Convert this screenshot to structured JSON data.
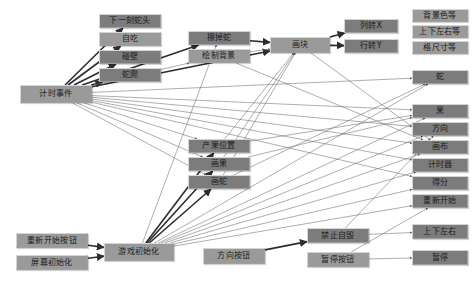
{
  "diagram": {
    "node_fill": "#8d8d8d",
    "node_border": "#c9c9c9",
    "edge_color": "#3a3a3a",
    "background": "#ffffff",
    "nodes": [
      {
        "id": "timer_event",
        "label": "计时事件",
        "x": 20,
        "y": 85,
        "w": 72,
        "h": 18,
        "tone": "light"
      },
      {
        "id": "next_head",
        "label": "下一刻蛇头",
        "x": 99,
        "y": 14,
        "w": 62,
        "h": 14,
        "tone": "dark"
      },
      {
        "id": "self_eat",
        "label": "自吃",
        "x": 99,
        "y": 32,
        "w": 62,
        "h": 14,
        "tone": "light"
      },
      {
        "id": "hit_wall",
        "label": "碰壁",
        "x": 99,
        "y": 50,
        "w": 62,
        "h": 14,
        "tone": "dark"
      },
      {
        "id": "snake_crawl",
        "label": "蛇爬",
        "x": 99,
        "y": 68,
        "w": 62,
        "h": 14,
        "tone": "dark"
      },
      {
        "id": "erase_snake",
        "label": "擦掉蛇",
        "x": 188,
        "y": 31,
        "w": 62,
        "h": 14,
        "tone": "dark"
      },
      {
        "id": "draw_bg",
        "label": "绘制背景",
        "x": 188,
        "y": 49,
        "w": 62,
        "h": 14,
        "tone": "light"
      },
      {
        "id": "draw_block",
        "label": "画块",
        "x": 270,
        "y": 37,
        "w": 60,
        "h": 16,
        "tone": "light"
      },
      {
        "id": "col_to_x",
        "label": "列转X",
        "x": 344,
        "y": 19,
        "w": 54,
        "h": 14,
        "tone": "dark"
      },
      {
        "id": "row_to_y",
        "label": "行转Y",
        "x": 344,
        "y": 39,
        "w": 54,
        "h": 14,
        "tone": "dark"
      },
      {
        "id": "bg_color_etc",
        "label": "背景色等",
        "x": 412,
        "y": 9,
        "w": 56,
        "h": 13,
        "tone": "light"
      },
      {
        "id": "updown_etc",
        "label": "上下左右等",
        "x": 412,
        "y": 25,
        "w": 56,
        "h": 13,
        "tone": "light"
      },
      {
        "id": "cell_size_etc",
        "label": "格尺寸等",
        "x": 412,
        "y": 41,
        "w": 56,
        "h": 13,
        "tone": "light"
      },
      {
        "id": "var_snake",
        "label": "蛇",
        "x": 412,
        "y": 70,
        "w": 56,
        "h": 14,
        "tone": "dark"
      },
      {
        "id": "var_fruit",
        "label": "果",
        "x": 412,
        "y": 104,
        "w": 56,
        "h": 14,
        "tone": "dark"
      },
      {
        "id": "var_direction",
        "label": "方向",
        "x": 412,
        "y": 122,
        "w": 56,
        "h": 14,
        "tone": "dark"
      },
      {
        "id": "var_canvas",
        "label": "画布",
        "x": 412,
        "y": 140,
        "w": 56,
        "h": 14,
        "tone": "dark"
      },
      {
        "id": "var_timer",
        "label": "计时器",
        "x": 412,
        "y": 158,
        "w": 56,
        "h": 14,
        "tone": "dark"
      },
      {
        "id": "var_score",
        "label": "得分",
        "x": 412,
        "y": 176,
        "w": 56,
        "h": 14,
        "tone": "dark"
      },
      {
        "id": "var_restart",
        "label": "重新开始",
        "x": 412,
        "y": 194,
        "w": 56,
        "h": 14,
        "tone": "dark"
      },
      {
        "id": "fruit_pos",
        "label": "产果位置",
        "x": 188,
        "y": 139,
        "w": 62,
        "h": 14,
        "tone": "dark"
      },
      {
        "id": "draw_fruit",
        "label": "画果",
        "x": 188,
        "y": 157,
        "w": 62,
        "h": 14,
        "tone": "dark"
      },
      {
        "id": "draw_snake",
        "label": "画蛇",
        "x": 188,
        "y": 175,
        "w": 62,
        "h": 14,
        "tone": "dark"
      },
      {
        "id": "restart_btn",
        "label": "重新开始按钮",
        "x": 16,
        "y": 233,
        "w": 72,
        "h": 15,
        "tone": "light"
      },
      {
        "id": "screen_init",
        "label": "屏幕初始化",
        "x": 16,
        "y": 255,
        "w": 72,
        "h": 15,
        "tone": "light"
      },
      {
        "id": "game_init",
        "label": "游戏初始化",
        "x": 104,
        "y": 243,
        "w": 70,
        "h": 18,
        "tone": "light"
      },
      {
        "id": "dir_btn",
        "label": "方向按钮",
        "x": 203,
        "y": 248,
        "w": 62,
        "h": 16,
        "tone": "light"
      },
      {
        "id": "no_suicide",
        "label": "禁止自毁",
        "x": 307,
        "y": 228,
        "w": 62,
        "h": 15,
        "tone": "dark"
      },
      {
        "id": "pause_btn",
        "label": "暂停按钮",
        "x": 307,
        "y": 252,
        "w": 62,
        "h": 15,
        "tone": "light"
      },
      {
        "id": "updown_lr",
        "label": "上下左右",
        "x": 412,
        "y": 224,
        "w": 56,
        "h": 15,
        "tone": "dark"
      },
      {
        "id": "pause",
        "label": "暂停",
        "x": 412,
        "y": 250,
        "w": 56,
        "h": 15,
        "tone": "dark"
      }
    ],
    "edges": [
      {
        "from": "timer_event",
        "to": "next_head",
        "weight": "bold"
      },
      {
        "from": "timer_event",
        "to": "self_eat",
        "weight": "bold"
      },
      {
        "from": "timer_event",
        "to": "hit_wall",
        "weight": "bold"
      },
      {
        "from": "timer_event",
        "to": "snake_crawl",
        "weight": "bold"
      },
      {
        "from": "timer_event",
        "to": "erase_snake",
        "weight": "bold"
      },
      {
        "from": "timer_event",
        "to": "draw_bg",
        "weight": "thin"
      },
      {
        "from": "timer_event",
        "to": "draw_block",
        "weight": "bold"
      },
      {
        "from": "timer_event",
        "to": "fruit_pos",
        "weight": "thin"
      },
      {
        "from": "timer_event",
        "to": "draw_fruit",
        "weight": "thin"
      },
      {
        "from": "timer_event",
        "to": "draw_snake",
        "weight": "thin"
      },
      {
        "from": "timer_event",
        "to": "var_snake",
        "weight": "thin"
      },
      {
        "from": "timer_event",
        "to": "var_fruit",
        "weight": "thin"
      },
      {
        "from": "timer_event",
        "to": "var_direction",
        "weight": "thin"
      },
      {
        "from": "timer_event",
        "to": "var_canvas",
        "weight": "thin"
      },
      {
        "from": "timer_event",
        "to": "var_timer",
        "weight": "thin"
      },
      {
        "from": "timer_event",
        "to": "var_score",
        "weight": "thin"
      },
      {
        "from": "erase_snake",
        "to": "draw_block",
        "weight": "bold"
      },
      {
        "from": "draw_bg",
        "to": "draw_block",
        "weight": "thin"
      },
      {
        "from": "draw_block",
        "to": "col_to_x",
        "weight": "bold"
      },
      {
        "from": "draw_block",
        "to": "row_to_y",
        "weight": "bold"
      },
      {
        "from": "draw_block",
        "to": "var_canvas",
        "weight": "thin"
      },
      {
        "from": "draw_bg",
        "to": "var_canvas",
        "weight": "thin"
      },
      {
        "from": "fruit_pos",
        "to": "draw_block",
        "weight": "thin"
      },
      {
        "from": "draw_fruit",
        "to": "draw_block",
        "weight": "thin"
      },
      {
        "from": "draw_snake",
        "to": "draw_block",
        "weight": "thin"
      },
      {
        "from": "fruit_pos",
        "to": "var_fruit",
        "weight": "thin"
      },
      {
        "from": "draw_fruit",
        "to": "var_fruit",
        "weight": "thin"
      },
      {
        "from": "draw_snake",
        "to": "var_snake",
        "weight": "thin"
      },
      {
        "from": "restart_btn",
        "to": "game_init",
        "weight": "bold"
      },
      {
        "from": "screen_init",
        "to": "game_init",
        "weight": "bold"
      },
      {
        "from": "game_init",
        "to": "fruit_pos",
        "weight": "bold"
      },
      {
        "from": "game_init",
        "to": "draw_fruit",
        "weight": "bold"
      },
      {
        "from": "game_init",
        "to": "draw_snake",
        "weight": "bold"
      },
      {
        "from": "game_init",
        "to": "erase_snake",
        "weight": "thin"
      },
      {
        "from": "game_init",
        "to": "var_fruit",
        "weight": "thin"
      },
      {
        "from": "game_init",
        "to": "var_direction",
        "weight": "thin"
      },
      {
        "from": "game_init",
        "to": "var_canvas",
        "weight": "thin"
      },
      {
        "from": "game_init",
        "to": "var_timer",
        "weight": "thin"
      },
      {
        "from": "game_init",
        "to": "var_score",
        "weight": "thin"
      },
      {
        "from": "game_init",
        "to": "var_restart",
        "weight": "thin"
      },
      {
        "from": "game_init",
        "to": "var_snake",
        "weight": "thin"
      },
      {
        "from": "dir_btn",
        "to": "no_suicide",
        "weight": "bold"
      },
      {
        "from": "no_suicide",
        "to": "updown_lr",
        "weight": "thin"
      },
      {
        "from": "pause_btn",
        "to": "pause",
        "weight": "thin"
      },
      {
        "from": "pause_btn",
        "to": "var_restart",
        "weight": "thin"
      },
      {
        "from": "no_suicide",
        "to": "var_direction",
        "weight": "thin"
      }
    ]
  }
}
